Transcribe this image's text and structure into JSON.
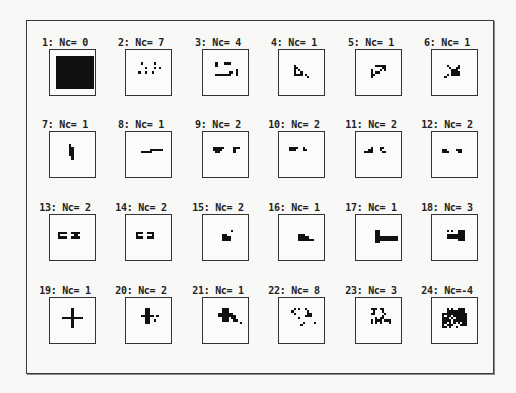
{
  "figure": {
    "cells": [
      {
        "label": "1: Nc= 0",
        "pattern": [
          "...................",
          "...................",
          "..#################",
          "..#################",
          "..#################",
          "..#################",
          "..#################",
          "..#################",
          "..#################",
          "..#################",
          "..#################",
          "..#################",
          "..#################",
          "..#################",
          "..#################",
          "..#################",
          "..#################",
          "...................",
          "..................."
        ]
      },
      {
        "label": "2: Nc= 7",
        "pattern": [
          "...................",
          "...................",
          "...................",
          "...................",
          "...................",
          "......#.....#......",
          "...................",
          "........#...#.#....",
          "...................",
          ".....#..#..#.......",
          "...................",
          "...................",
          "...................",
          "...................",
          "...................",
          "...................",
          "...................",
          "...................",
          "..................."
        ]
      },
      {
        "label": "3: Nc= 4",
        "pattern": [
          "...................",
          "...................",
          "...................",
          "...................",
          "...................",
          ".....#...###.......",
          ".....#.............",
          "...................",
          "..............#....",
          "...........##.#....",
          ".....#######..#....",
          "...................",
          "...................",
          "...................",
          "...................",
          "...................",
          "...................",
          "...................",
          "..................."
        ]
      },
      {
        "label": "4: Nc= 1",
        "pattern": [
          "...................",
          "...................",
          "...................",
          "...................",
          "...................",
          "...................",
          "......#............",
          "......##...........",
          "......#.#..........",
          "......#..#.........",
          "......####.#.......",
          "............#......",
          "...................",
          "...................",
          "...................",
          "...................",
          "...................",
          "...................",
          "..................."
        ]
      },
      {
        "label": "5: Nc= 1",
        "pattern": [
          "...................",
          "...................",
          "...................",
          "...................",
          "...................",
          "...................",
          "........#####......",
          "...........##......",
          "......#...#.#......",
          "......#.##.........",
          "......##...........",
          "......#............",
          "...................",
          "...................",
          "...................",
          "...................",
          "...................",
          "...................",
          "..................."
        ]
      },
      {
        "label": "6: Nc= 1",
        "pattern": [
          "...................",
          "...................",
          "...................",
          "...................",
          "...................",
          "...................",
          "......#....#.......",
          ".......#..##.......",
          "........###........",
          "........####.......",
          "......#.####.......",
          ".....#.............",
          "...................",
          "...................",
          "...................",
          "...................",
          "...................",
          "...................",
          "..................."
        ]
      },
      {
        "label": "7: Nc= 1",
        "pattern": [
          "...................",
          "...................",
          "...................",
          "...................",
          "...................",
          "........#..........",
          "........##.........",
          "........##.........",
          "........##.........",
          "........##.........",
          ".........#.........",
          ".........#.........",
          "...................",
          "...................",
          "...................",
          "...................",
          "...................",
          "...................",
          "..................."
        ]
      },
      {
        "label": "8: Nc= 1",
        "pattern": [
          "...................",
          "...................",
          "...................",
          "...................",
          "...................",
          "...................",
          "...................",
          "..........######...",
          "......#####........",
          "...................",
          "...................",
          "...................",
          "...................",
          "...................",
          "...................",
          "...................",
          "...................",
          "...................",
          "..................."
        ]
      },
      {
        "label": "9: Nc= 2",
        "pattern": [
          "...................",
          "...................",
          "...................",
          "...................",
          "...................",
          "...................",
          "....#####....###...",
          "....####.....#.....",
          ".....##......#.....",
          "...................",
          "...................",
          "...................",
          "...................",
          "...................",
          "...................",
          "...................",
          "...................",
          "...................",
          "..................."
        ]
      },
      {
        "label": "10: Nc= 2",
        "pattern": [
          "...................",
          "...................",
          "...................",
          "...................",
          "...................",
          "...................",
          "....####..#........",
          "....###...##.......",
          "...................",
          "...................",
          "...................",
          "...................",
          "...................",
          "...................",
          "...................",
          "...................",
          "...................",
          "...................",
          "..................."
        ]
      },
      {
        "label": "11: Nc= 2",
        "pattern": [
          "...................",
          "...................",
          "...................",
          "...................",
          "...................",
          "...................",
          "......#...##.......",
          ".....##...#........",
          "...####....##......",
          "...................",
          "...................",
          "...................",
          "...................",
          "...................",
          "...................",
          "...................",
          "...................",
          "...................",
          "..................."
        ]
      },
      {
        "label": "12: Nc= 2",
        "pattern": [
          "...................",
          "...................",
          "...................",
          "...................",
          "...................",
          "...................",
          "...................",
          "....##....###......",
          "....###....##......",
          "...................",
          "...................",
          "...................",
          "...................",
          "...................",
          "...................",
          "...................",
          "...................",
          "...................",
          "..................."
        ]
      },
      {
        "label": "13: Nc= 2",
        "pattern": [
          "...................",
          "...................",
          "...................",
          "...................",
          "...................",
          "...................",
          "...................",
          "...####..####......",
          "...#......##.......",
          "...####..####......",
          "...................",
          "...................",
          "...................",
          "...................",
          "...................",
          "...................",
          "...................",
          "...................",
          "..................."
        ]
      },
      {
        "label": "14: Nc= 2",
        "pattern": [
          "...................",
          "...................",
          "...................",
          "...................",
          "...................",
          "...................",
          "...................",
          "....###..###.......",
          "....#......#.......",
          "....###..###.......",
          "...................",
          "...................",
          "...................",
          "...................",
          "...................",
          "...................",
          "...................",
          "...................",
          "..................."
        ]
      },
      {
        "label": "15: Nc= 2",
        "pattern": [
          "...................",
          "...................",
          "...................",
          "...................",
          "...................",
          "...................",
          "............#......",
          "...................",
          "........##.........",
          "........####.......",
          "........####.......",
          "...................",
          "...................",
          "...................",
          "...................",
          "...................",
          "...................",
          "...................",
          "..................."
        ]
      },
      {
        "label": "16: Nc= 1",
        "pattern": [
          "...................",
          "...................",
          "...................",
          "...................",
          "...................",
          "...................",
          "...................",
          "...................",
          "........###........",
          "........#####......",
          "........#######....",
          "...................",
          "...................",
          "...................",
          "...................",
          "...................",
          "...................",
          "...................",
          "..................."
        ]
      },
      {
        "label": "17: Nc= 1",
        "pattern": [
          "...................",
          "...................",
          "...................",
          "...................",
          "...................",
          "...................",
          "........##.........",
          "........##.........",
          "........##.........",
          "........##########.",
          "........##########.",
          "........##.........",
          "...................",
          "...................",
          "...................",
          "...................",
          "...................",
          "...................",
          "..................."
        ]
      },
      {
        "label": "18: Nc= 3",
        "pattern": [
          "...................",
          "...................",
          "...................",
          "...................",
          "...................",
          "...................",
          "......#.#..###.....",
          "...........###.....",
          "......########.....",
          "......########.....",
          "...........###.....",
          "...................",
          "...................",
          "...................",
          "...................",
          "...................",
          "...................",
          "...................",
          "..................."
        ]
      },
      {
        "label": "19: Nc= 1",
        "pattern": [
          "...................",
          "...................",
          "...................",
          "...................",
          ".........#.........",
          ".........#.........",
          ".........#.........",
          ".........#.........",
          ".....#########.....",
          ".........#.........",
          ".........#.........",
          ".........#.........",
          ".........#.........",
          "...................",
          "...................",
          "...................",
          "...................",
          "...................",
          "..................."
        ]
      },
      {
        "label": "20: Nc= 2",
        "pattern": [
          "...................",
          "...................",
          "...................",
          "...................",
          "........##.........",
          "........##.........",
          "........##.........",
          "......######.#.....",
          "........##.........",
          "........##..#......",
          "........##.........",
          "...................",
          "...................",
          "...................",
          "...................",
          "...................",
          "...................",
          "...................",
          "..................."
        ]
      },
      {
        "label": "21: Nc= 1",
        "pattern": [
          "...................",
          "...................",
          "...................",
          "...................",
          "........###........",
          "........###........",
          "......#######......",
          "......########.....",
          "........###.##.....",
          "........###..##....",
          "................#..",
          "...................",
          "...................",
          "...................",
          "...................",
          "...................",
          "...................",
          "...................",
          "..................."
        ]
      },
      {
        "label": "22: Nc= 8",
        "pattern": [
          "...................",
          "...................",
          "...................",
          "...................",
          "......#.#..#.......",
          ".....#......#......",
          "......#.....##.....",
          "...........###.....",
          "........#..........",
          "...................",
          "..........#....#...",
          ".........#.........",
          "...................",
          "...................",
          "...................",
          "...................",
          "...................",
          "...................",
          "..................."
        ]
      },
      {
        "label": "23: Nc= 3",
        "pattern": [
          "...................",
          "...................",
          "...................",
          "...................",
          "......###.##.......",
          ".......#...#.......",
          "......##....#......",
          "...........#.......",
          "........#.##.......",
          "......#.###.###....",
          "......#.#.#...#....",
          "...................",
          "...................",
          "...................",
          "...................",
          "...................",
          "...................",
          "...................",
          "..................."
        ]
      },
      {
        "label": "24: Nc=-4",
        "pattern": [
          "...................",
          "...................",
          "...................",
          "...................",
          "......#.#..###.....",
          "......########.....",
          "....###########....",
          "....#.##.######....",
          "....###.#.#####....",
          "....####.######....",
          "....##.#.#.#.##....",
          "....#.###...###....",
          "....##.#..#........",
          "...................",
          "...................",
          "...................",
          "...................",
          "...................",
          "..................."
        ]
      }
    ]
  }
}
